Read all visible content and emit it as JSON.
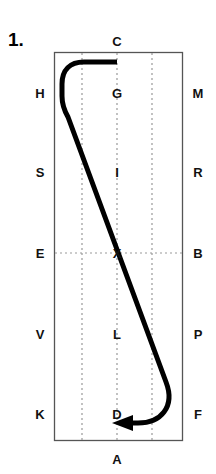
{
  "figure": {
    "number_label": "1.",
    "kind": "dressage-arena-diagram",
    "colors": {
      "arena_border": "#555555",
      "centerline": "#999999",
      "quarterline": "#999999",
      "path": "#000000",
      "text": "#111111",
      "background": "#ffffff"
    }
  },
  "arena": {
    "border_label": "arena-rectangle",
    "left_px": 54,
    "right_px": 183,
    "top_px": 52,
    "bottom_px": 441,
    "dotted_vertical_x": [
      82,
      117,
      152
    ],
    "dotted_horizontal_y": 253
  },
  "markers": {
    "top": [
      {
        "letter": "C",
        "x": 117,
        "y": 41
      }
    ],
    "bottom": [
      {
        "letter": "A",
        "x": 117,
        "y": 459
      }
    ],
    "left": [
      {
        "letter": "H",
        "x": 40,
        "y": 93
      },
      {
        "letter": "S",
        "x": 40,
        "y": 172
      },
      {
        "letter": "E",
        "x": 40,
        "y": 253
      },
      {
        "letter": "V",
        "x": 40,
        "y": 334
      },
      {
        "letter": "K",
        "x": 40,
        "y": 414
      }
    ],
    "right": [
      {
        "letter": "M",
        "x": 198,
        "y": 93
      },
      {
        "letter": "R",
        "x": 198,
        "y": 172
      },
      {
        "letter": "B",
        "x": 198,
        "y": 253
      },
      {
        "letter": "P",
        "x": 198,
        "y": 334
      },
      {
        "letter": "F",
        "x": 198,
        "y": 414
      }
    ],
    "centre": [
      {
        "letter": "G",
        "x": 117,
        "y": 93
      },
      {
        "letter": "I",
        "x": 117,
        "y": 172
      },
      {
        "letter": "X",
        "x": 117,
        "y": 253
      },
      {
        "letter": "L",
        "x": 117,
        "y": 334
      },
      {
        "letter": "D",
        "x": 117,
        "y": 414
      }
    ]
  },
  "path": {
    "name": "ridden-track",
    "description": "Track starts at C on the centre line, turns left along the short side, curves down the left long side, crosses the diagonal through X to the right long side, then curves around the bottom right corner and finishes with an arrowhead pointing left at A.",
    "start_marker": "C",
    "through_marker": "X",
    "end_marker": "A",
    "arrow_direction": "left",
    "stroke_width_px": 5
  }
}
